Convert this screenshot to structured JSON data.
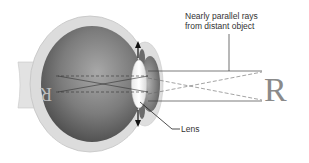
{
  "diagram": {
    "type": "eye-focusing-distant-object",
    "labels": {
      "rays_line1": "Nearly parallel rays",
      "rays_line2": "from distant object",
      "lens": "Lens"
    },
    "object_letter": "R",
    "image_letter": "R",
    "colors": {
      "sclera": "#dcdcdc",
      "eyeball_interior": "#7a7a7a",
      "lens": "#f2f2f2",
      "ray_line": "#444444",
      "object_letter": "#8a8a8a",
      "label_text": "#333333"
    }
  }
}
